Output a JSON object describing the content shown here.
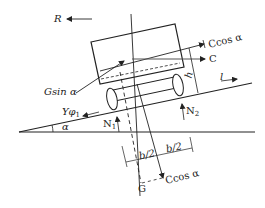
{
  "diagram": {
    "labels": {
      "R": "R",
      "C_cos_alpha_top": "Ccos α",
      "C": "C",
      "h": "h",
      "l": "l",
      "G_sin_alpha": "Gsin α",
      "Y_phi": "Yφ",
      "Y_phi_sub": "1",
      "alpha": "α",
      "N1": "N",
      "N1_sub": "1",
      "N2": "N",
      "N2_sub": "2",
      "b_half_left": "b/2",
      "b_half_right": "b/2",
      "G": "G",
      "C_cos_alpha_bottom": "Ccos α"
    },
    "colors": {
      "stroke": "#222222",
      "background": "#ffffff",
      "text": "#222222"
    }
  }
}
